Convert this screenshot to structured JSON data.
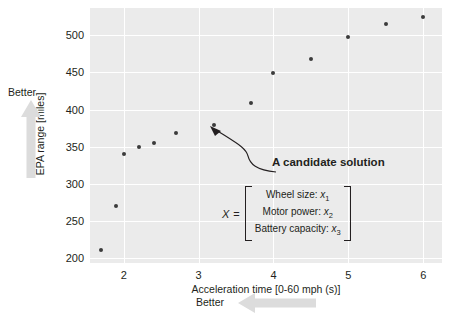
{
  "chart_data": {
    "type": "scatter",
    "title": "",
    "xlabel": "Acceleration time [0-60 mph (s)]",
    "ylabel": "EPA range [miles]",
    "xlim": [
      1.55,
      6.25
    ],
    "ylim": [
      193,
      537
    ],
    "xticks": [
      2,
      3,
      4,
      5,
      6
    ],
    "yticks": [
      200,
      250,
      300,
      350,
      400,
      450,
      500
    ],
    "xtick_labels": [
      "2",
      "3",
      "4",
      "5",
      "6"
    ],
    "ytick_labels": [
      "200",
      "250",
      "300",
      "350",
      "400",
      "450",
      "500"
    ],
    "grid": true,
    "legend": "none",
    "marker_color": "#3b3b3b",
    "panel_color": "#ebebeb",
    "grid_color": "#ffffff",
    "points": [
      {
        "x": 1.7,
        "y": 211
      },
      {
        "x": 1.9,
        "y": 270
      },
      {
        "x": 2.0,
        "y": 340
      },
      {
        "x": 2.2,
        "y": 350
      },
      {
        "x": 2.4,
        "y": 355
      },
      {
        "x": 2.7,
        "y": 369
      },
      {
        "x": 3.2,
        "y": 379
      },
      {
        "x": 3.7,
        "y": 409
      },
      {
        "x": 4.0,
        "y": 449
      },
      {
        "x": 4.5,
        "y": 468
      },
      {
        "x": 5.0,
        "y": 498
      },
      {
        "x": 5.5,
        "y": 516
      },
      {
        "x": 6.0,
        "y": 525
      }
    ],
    "annotations": [
      {
        "name": "candidate-solution",
        "title": "A candidate solution",
        "target_point": {
          "x": 3.2,
          "y": 379
        },
        "vector_symbol": "X",
        "equals": "=",
        "vector_rows": [
          {
            "label": "Wheel size:",
            "variable": "x",
            "subscript": "1"
          },
          {
            "label": "Motor power:",
            "variable": "x",
            "subscript": "2"
          },
          {
            "label": "Battery capacity:",
            "variable": "x",
            "subscript": "3"
          }
        ]
      }
    ],
    "direction_indicators": [
      {
        "name": "better-vertical",
        "label": "Better",
        "direction": "up"
      },
      {
        "name": "better-horizontal",
        "label": "Better",
        "direction": "left"
      }
    ]
  }
}
